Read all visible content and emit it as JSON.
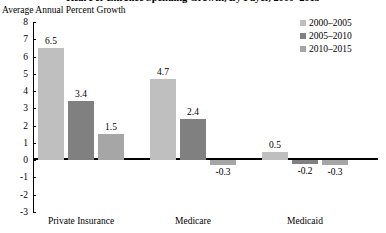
{
  "chart_data": {
    "type": "bar",
    "title": "Real Per Enrollee Spending Growth, By Payer, 2000–2015",
    "subtitle": "Average Annual Percent Growth",
    "xlabel": "",
    "ylabel": "Average Annual Percent Growth",
    "ylim": [
      -3,
      8
    ],
    "ytick_labels": [
      "8",
      "7",
      "6",
      "5",
      "4",
      "3",
      "2",
      "1",
      "0",
      "-1",
      "-2",
      "-3"
    ],
    "ytick_values": [
      8,
      7,
      6,
      5,
      4,
      3,
      2,
      1,
      0,
      -1,
      -2,
      -3
    ],
    "grid": false,
    "legend_position": "top-right",
    "categories": [
      "Private Insurance",
      "Medicare",
      "Medicaid"
    ],
    "series": [
      {
        "name": "2000–2005",
        "color": "#bfbfbf",
        "values": [
          6.5,
          4.7,
          0.5
        ],
        "labels": [
          "6.5",
          "4.7",
          "0.5"
        ]
      },
      {
        "name": "2005–2010",
        "color": "#808080",
        "values": [
          3.4,
          2.4,
          -0.2
        ],
        "labels": [
          "3.4",
          "2.4",
          "-0.2"
        ]
      },
      {
        "name": "2010–2015",
        "color": "#a6a6a6",
        "values": [
          1.5,
          -0.3,
          -0.3
        ],
        "labels": [
          "1.5",
          "-0.3",
          "-0.3"
        ]
      }
    ]
  }
}
